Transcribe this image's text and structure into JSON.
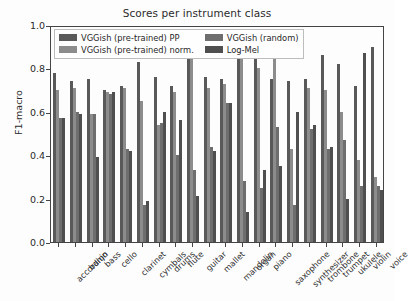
{
  "chart_data": {
    "type": "bar",
    "title": "Scores per instrument class",
    "xlabel": "",
    "ylabel": "F1-macro",
    "ylim": [
      0.0,
      1.0
    ],
    "yticks": [
      "0.0",
      "0.2",
      "0.4",
      "0.6",
      "0.8",
      "1.0"
    ],
    "ytick_values": [
      0.0,
      0.2,
      0.4,
      0.6,
      0.8,
      1.0
    ],
    "grid": false,
    "legend_position": "upper left",
    "categories": [
      "accordion",
      "banjo",
      "bass",
      "cello",
      "clarinet",
      "cymbals",
      "drums",
      "flute",
      "guitar",
      "mallet",
      "mandolin",
      "organ",
      "piano",
      "saxophone",
      "synthesizer",
      "trombone",
      "trumpet",
      "ukulele",
      "violin",
      "voice"
    ],
    "series": [
      {
        "name": "VGGish (pre-trained) PP",
        "color": "#595959",
        "values": [
          0.78,
          0.74,
          0.75,
          0.7,
          0.72,
          0.83,
          0.76,
          0.72,
          0.92,
          0.76,
          0.75,
          0.92,
          0.93,
          0.75,
          0.74,
          0.75,
          0.86,
          0.82,
          0.72,
          0.9
        ]
      },
      {
        "name": "VGGish (pre-trained) norm.",
        "color": "#8c8c8c",
        "values": [
          0.7,
          0.71,
          0.59,
          0.69,
          0.71,
          0.65,
          0.54,
          0.69,
          0.85,
          0.71,
          0.73,
          0.87,
          0.8,
          0.88,
          0.43,
          0.71,
          0.7,
          0.6,
          0.38,
          0.3
        ]
      },
      {
        "name": "VGGish (random)",
        "color": "#6e6e6e",
        "values": [
          0.57,
          0.6,
          0.59,
          0.68,
          0.43,
          0.17,
          0.55,
          0.4,
          0.33,
          0.44,
          0.64,
          0.28,
          0.25,
          0.53,
          0.17,
          0.52,
          0.43,
          0.47,
          0.26,
          0.26
        ]
      },
      {
        "name": "Log-Mel",
        "color": "#4f4f4f",
        "values": [
          0.57,
          0.59,
          0.39,
          0.69,
          0.42,
          0.19,
          0.6,
          0.56,
          0.21,
          0.42,
          0.64,
          0.14,
          0.33,
          0.35,
          0.6,
          0.54,
          0.44,
          0.2,
          0.87,
          0.24
        ]
      }
    ]
  }
}
